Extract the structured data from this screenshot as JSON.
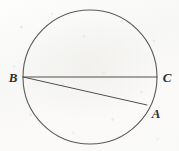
{
  "figure": {
    "kind": "circle-with-chords",
    "canvas": {
      "width": 179,
      "height": 151
    },
    "background_color": "#fafaf8",
    "stroke_color": "#5a5a5a",
    "label_color": "#2e2e2e",
    "circle": {
      "name": "circle-outline",
      "cx": 90,
      "cy": 77,
      "r": 67,
      "stroke_width": 1.1
    },
    "points": [
      {
        "id": "B",
        "label": "B",
        "x": 23,
        "y": 77,
        "label_x": 13,
        "label_y": 82,
        "anchor": "middle"
      },
      {
        "id": "C",
        "label": "C",
        "x": 157,
        "y": 77,
        "label_x": 167,
        "label_y": 82,
        "anchor": "middle"
      },
      {
        "id": "A",
        "label": "A",
        "x": 147,
        "y": 105,
        "label_x": 156,
        "label_y": 118,
        "anchor": "middle"
      }
    ],
    "segments": [
      {
        "id": "BC",
        "name": "chord-b-to-c",
        "from": "B",
        "to": "C",
        "x1": 23,
        "y1": 77,
        "x2": 157,
        "y2": 77,
        "stroke_width": 1.0
      },
      {
        "id": "BA",
        "name": "chord-b-to-a",
        "from": "B",
        "to": "A",
        "x1": 23,
        "y1": 77,
        "x2": 147,
        "y2": 105,
        "stroke_width": 1.0
      }
    ],
    "label_font_size": 13
  }
}
